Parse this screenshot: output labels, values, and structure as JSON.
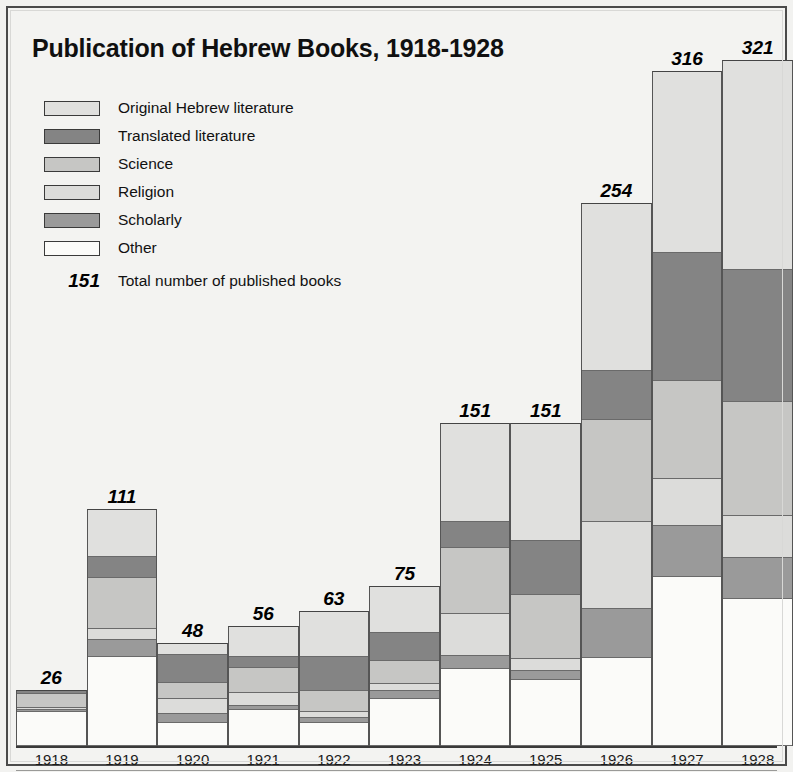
{
  "chart_data": {
    "type": "bar",
    "subtype": "stacked-bar",
    "title": "Publication of Hebrew Books, 1918-1928",
    "xlabel": "",
    "ylabel": "",
    "grid": false,
    "legend_position": "top-left",
    "total_label": "Total number of published books",
    "total_example_value": "151",
    "categories": [
      "1918",
      "1919",
      "1920",
      "1921",
      "1922",
      "1923",
      "1924",
      "1925",
      "1926",
      "1927",
      "1928"
    ],
    "totals": [
      26,
      111,
      48,
      56,
      63,
      75,
      151,
      151,
      254,
      316,
      321
    ],
    "series": [
      {
        "name": "Original Hebrew literature",
        "color": "#e0e0de",
        "values": [
          0,
          22,
          5,
          14,
          21,
          22,
          46,
          55,
          78,
          85,
          98
        ]
      },
      {
        "name": "Translated literature",
        "color": "#848484",
        "values": [
          1,
          10,
          13,
          5,
          16,
          13,
          12,
          25,
          23,
          60,
          62
        ]
      },
      {
        "name": "Science",
        "color": "#c6c6c4",
        "values": [
          7,
          24,
          8,
          12,
          10,
          11,
          31,
          30,
          48,
          46,
          53
        ]
      },
      {
        "name": "Religion",
        "color": "#dcdcda",
        "values": [
          1,
          5,
          7,
          6,
          3,
          3,
          20,
          6,
          41,
          22,
          20
        ]
      },
      {
        "name": "Scholarly",
        "color": "#9a9a9a",
        "values": [
          1,
          8,
          4,
          2,
          2,
          4,
          6,
          4,
          23,
          24,
          19
        ]
      },
      {
        "name": "Other",
        "color": "#fbfbf9",
        "values": [
          16,
          42,
          11,
          17,
          11,
          22,
          36,
          31,
          41,
          79,
          69
        ]
      }
    ]
  },
  "legend": {
    "items": [
      {
        "label": "Original Hebrew literature",
        "color": "#e0e0de"
      },
      {
        "label": "Translated literature",
        "color": "#848484"
      },
      {
        "label": "Science",
        "color": "#c6c6c4"
      },
      {
        "label": "Religion",
        "color": "#dcdcda"
      },
      {
        "label": "Scholarly",
        "color": "#9a9a9a"
      },
      {
        "label": "Other",
        "color": "#fbfbf9"
      }
    ],
    "total_value": "151",
    "total_text": "Total number of published books"
  }
}
